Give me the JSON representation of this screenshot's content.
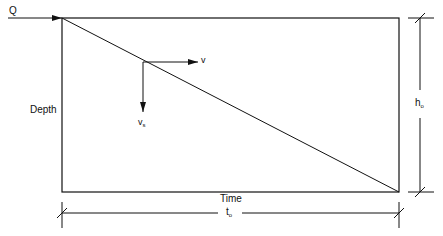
{
  "diagram": {
    "inflow_label": "Q",
    "velocity_label": "v",
    "settling_label": "v",
    "settling_sub": "s",
    "depth_label": "Depth",
    "time_label": "Time",
    "height_dim": "h",
    "height_sub": "o",
    "time_dim": "t",
    "time_sub": "o",
    "colors": {
      "line": "#111111",
      "background": "#ffffff"
    }
  }
}
